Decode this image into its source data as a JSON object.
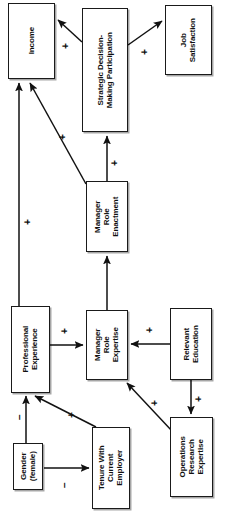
{
  "diagram": {
    "orientation": "rotated-90-ccw",
    "nodes": [
      {
        "id": "income",
        "label": "Income",
        "x": 8,
        "y": 3,
        "w": 47,
        "h": 76
      },
      {
        "id": "sdmp",
        "label": "Strategic Decision-\nMaking Participation",
        "x": 82,
        "y": 8,
        "w": 46,
        "h": 124
      },
      {
        "id": "jobsat",
        "label": "Job\nSatisfaction",
        "x": 165,
        "y": 5,
        "w": 47,
        "h": 70
      },
      {
        "id": "mre_enact",
        "label": "Manager\nRole\nEnactment",
        "x": 86,
        "y": 181,
        "w": 42,
        "h": 71
      },
      {
        "id": "profexp",
        "label": "Professional\nExperience",
        "x": 11,
        "y": 306,
        "w": 39,
        "h": 87
      },
      {
        "id": "mre_expert",
        "label": "Manager\nRole\nExpertise",
        "x": 86,
        "y": 310,
        "w": 42,
        "h": 70
      },
      {
        "id": "releduc",
        "label": "Relevant\nEducation",
        "x": 170,
        "y": 308,
        "w": 42,
        "h": 72
      },
      {
        "id": "gender",
        "label": "Gender\n(female)",
        "x": 13,
        "y": 443,
        "w": 30,
        "h": 47
      },
      {
        "id": "tenure",
        "label": "Tenure With\nCurrent\nEmployer",
        "x": 92,
        "y": 427,
        "w": 38,
        "h": 82
      },
      {
        "id": "orexp",
        "label": "Operations\nResearch\nExpertise",
        "x": 170,
        "y": 417,
        "w": 43,
        "h": 80
      }
    ],
    "edges": [
      {
        "id": "sdmp-income",
        "from": "sdmp",
        "to": "income",
        "sign": "+",
        "sign_x": 66,
        "sign_y": 46,
        "path": "M 82 42 L 58 20"
      },
      {
        "id": "sdmp-jobsat",
        "from": "sdmp",
        "to": "jobsat",
        "sign": "+",
        "sign_x": 145,
        "sign_y": 52,
        "path": "M 128 45 L 162 21"
      },
      {
        "id": "enact-sdmp",
        "from": "mre_enact",
        "to": "sdmp",
        "sign": "+",
        "sign_x": 115,
        "sign_y": 163,
        "path": "M 107 181 L 107 136"
      },
      {
        "id": "enact-income",
        "from": "mre_enact",
        "to": "income",
        "sign": "+",
        "sign_x": 63,
        "sign_y": 137,
        "path": "M 86 184 L 30 83"
      },
      {
        "id": "profexp-income",
        "from": "profexp",
        "to": "income",
        "sign": "+",
        "sign_x": 28,
        "sign_y": 222,
        "path": "M 19 306 L 19 83"
      },
      {
        "id": "expert-enact",
        "from": "mre_expert",
        "to": "mre_enact",
        "sign": "",
        "sign_x": 0,
        "sign_y": 0,
        "path": "M 107 310 L 107 256"
      },
      {
        "id": "profexp-expert",
        "from": "profexp",
        "to": "mre_expert",
        "sign": "+",
        "sign_x": 65,
        "sign_y": 331,
        "path": "M 50 345 L 83 345"
      },
      {
        "id": "releduc-expert",
        "from": "releduc",
        "to": "mre_expert",
        "sign": "+",
        "sign_x": 150,
        "sign_y": 330,
        "path": "M 170 344 L 131 344"
      },
      {
        "id": "releduc-orexp",
        "from": "releduc",
        "to": "orexp",
        "sign": "+",
        "sign_x": 199,
        "sign_y": 399,
        "path": "M 191 380 L 191 414"
      },
      {
        "id": "orexp-expert",
        "from": "orexp",
        "to": "mre_expert",
        "sign": "+",
        "sign_x": 155,
        "sign_y": 403,
        "path": "M 172 431 L 127 383"
      },
      {
        "id": "tenure-profexp",
        "from": "tenure",
        "to": "profexp",
        "sign": "+",
        "sign_x": 72,
        "sign_y": 415,
        "path": "M 96 427 L 35 396"
      },
      {
        "id": "gender-profexp",
        "from": "gender",
        "to": "profexp",
        "sign": "−",
        "sign_x": 20,
        "sign_y": 417,
        "path": "M 26 443 L 26 396"
      },
      {
        "id": "gender-tenure",
        "from": "gender",
        "to": "tenure",
        "sign": "−",
        "sign_x": 65,
        "sign_y": 485,
        "path": "M 44 468 L 89 468"
      }
    ]
  }
}
